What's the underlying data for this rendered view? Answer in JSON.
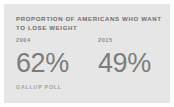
{
  "card": {
    "background_color": "#e6e6e6",
    "page_background_color": "#ffffff"
  },
  "headline": "Proportion of Americans who want\nto lose weight",
  "source": "Gallup Poll",
  "colors": {
    "headline": "#6e6e6e",
    "year_label": "#8a8a8a",
    "value": "#7d7d7d",
    "source": "#a2a2a2"
  },
  "chart_data": {
    "type": "table",
    "title": "Proportion of Americans who want to lose weight",
    "categories": [
      "2004",
      "2015"
    ],
    "values": [
      62,
      49
    ],
    "value_labels": [
      "62%",
      "49%"
    ],
    "unit": "%",
    "ylabel": "",
    "xlabel": "",
    "legend": "none",
    "grid": false,
    "source": "Gallup Poll"
  }
}
